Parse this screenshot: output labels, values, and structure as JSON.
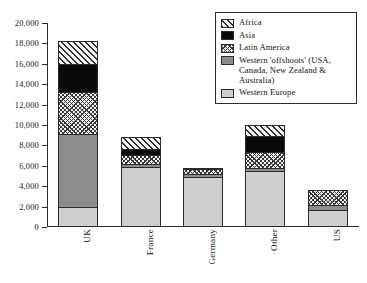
{
  "chart_data": {
    "type": "bar",
    "title": "",
    "subtitle": "",
    "xlabel": "",
    "ylabel": "",
    "stacked": true,
    "orientation": "vertical",
    "grid": false,
    "legend_position": "top-right",
    "ylim": [
      0,
      20000
    ],
    "ytick_step": 2000,
    "categories": [
      "UK",
      "France",
      "Germany",
      "Other",
      "US"
    ],
    "ytick_labels": [
      "0",
      "2,000",
      "4,000",
      "6,000",
      "8,000",
      "10,000",
      "12,000",
      "14,000",
      "16,000",
      "18,000",
      "20,000"
    ],
    "ytick_values": [
      0,
      2000,
      4000,
      6000,
      8000,
      10000,
      12000,
      14000,
      16000,
      18000,
      20000
    ],
    "series": [
      {
        "name": "Western Europe",
        "key": "westeur",
        "fill": "solid-light-gray",
        "color": "#cfcfcf",
        "values": [
          1800,
          5800,
          4900,
          5400,
          1600
        ]
      },
      {
        "name": "Western 'offshoots' (USA, Canada, New Zealand & Australia)",
        "key": "offshoots",
        "fill": "solid-mid-gray",
        "color": "#8c8c8c",
        "values": [
          7200,
          300,
          300,
          300,
          500
        ]
      },
      {
        "name": "Latin America",
        "key": "latin",
        "fill": "crosshatch",
        "color": "#f1f1f1",
        "values": [
          4200,
          900,
          500,
          1600,
          1500
        ]
      },
      {
        "name": "Asia",
        "key": "asia",
        "fill": "solid-black",
        "color": "#0a0a0a",
        "values": [
          2800,
          600,
          0,
          1600,
          0
        ]
      },
      {
        "name": "Africa",
        "key": "africa",
        "fill": "diagonal-hatch",
        "color": "#f3f3f3",
        "values": [
          2200,
          1200,
          100,
          1100,
          0
        ]
      }
    ],
    "totals": [
      18200,
      8800,
      5800,
      10000,
      3600
    ]
  },
  "legend": {
    "entries": [
      {
        "label": "Africa"
      },
      {
        "label": "Asia"
      },
      {
        "label": "Latin America"
      },
      {
        "label": "Western 'offshoots' (USA, Canada, New Zealand & Australia)"
      },
      {
        "label": "Western Europe"
      }
    ]
  },
  "axis": {
    "y_labels": [
      "20,000",
      "18,000",
      "16,000",
      "14,000",
      "12,000",
      "10,000",
      "8,000",
      "6,000",
      "4,000",
      "2,000",
      "0"
    ],
    "x_labels": [
      "UK",
      "France",
      "Germany",
      "Other",
      "US"
    ]
  }
}
